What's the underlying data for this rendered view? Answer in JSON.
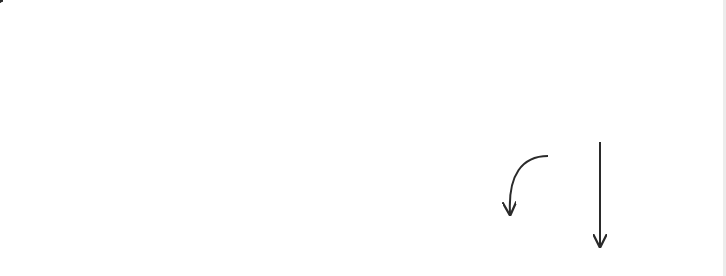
{
  "worksheet": {
    "title": "Letter A/a tracing guide",
    "colors": {
      "line": "#333333",
      "dot": "#222222",
      "arrow": "#2a2a2a",
      "dash": "#555555"
    },
    "guidelines": {
      "top_y": 24,
      "mid_y": 137,
      "base_y": 251,
      "x_start": 42,
      "x_end": 726
    },
    "uppercase": {
      "letter": "A",
      "dots": [
        [
          221,
          30
        ],
        [
          213,
          48
        ],
        [
          206,
          68
        ],
        [
          199,
          88
        ],
        [
          191,
          108
        ],
        [
          181,
          128
        ],
        [
          173,
          148
        ],
        [
          164,
          168
        ],
        [
          157,
          187
        ],
        [
          148,
          207
        ],
        [
          140,
          227
        ],
        [
          131,
          246
        ],
        [
          233,
          48
        ],
        [
          239,
          68
        ],
        [
          246,
          88
        ],
        [
          252,
          108
        ],
        [
          267,
          128
        ],
        [
          275,
          148
        ],
        [
          283,
          168
        ],
        [
          292,
          187
        ],
        [
          301,
          207
        ],
        [
          309,
          227
        ],
        [
          317,
          246
        ],
        [
          194,
          168
        ],
        [
          214,
          168
        ],
        [
          233,
          168
        ],
        [
          254,
          168
        ]
      ],
      "strokes": [
        {
          "label": "1",
          "label_pos": [
            181,
            50
          ],
          "from": [
            199,
            40
          ],
          "to": [
            169,
            112
          ]
        },
        {
          "label": "2",
          "label_pos": [
            262,
            50
          ],
          "from": [
            246,
            40
          ],
          "to": [
            276,
            112
          ]
        },
        {
          "label": "3",
          "label_pos": [
            175,
            210
          ],
          "from": [
            175,
            186
          ],
          "to": [
            272,
            186
          ]
        }
      ]
    },
    "lowercase": {
      "letter": "a",
      "dots": [
        [
          531,
          145
        ],
        [
          552,
          143
        ],
        [
          572,
          151
        ],
        [
          587,
          148
        ],
        [
          512,
          156
        ],
        [
          499,
          175
        ],
        [
          494,
          195
        ],
        [
          501,
          216
        ],
        [
          513,
          232
        ],
        [
          532,
          244
        ],
        [
          553,
          244
        ],
        [
          573,
          238
        ],
        [
          587,
          244
        ],
        [
          587,
          167
        ],
        [
          587,
          194
        ],
        [
          587,
          222
        ]
      ],
      "strokes": [
        {
          "label": "1",
          "label_pos": [
            565,
            180
          ]
        },
        {
          "label": "2",
          "label_pos": [
            605,
            162
          ]
        }
      ]
    }
  }
}
